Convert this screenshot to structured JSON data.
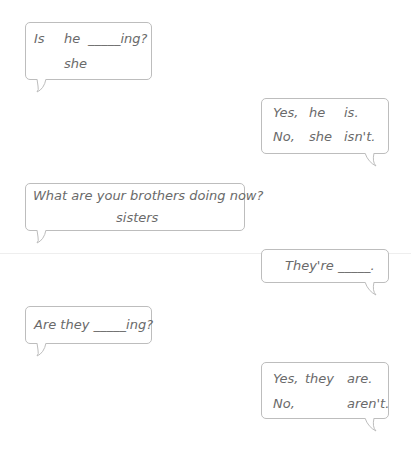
{
  "bubbles": [
    {
      "id": "q1",
      "lines": {
        "a": "Is",
        "b": "he",
        "c": "_____ing?",
        "d": "she"
      }
    },
    {
      "id": "a1",
      "lines": {
        "a": "Yes,",
        "b": "he",
        "c": "is.",
        "d": "No,",
        "e": "she",
        "f": "isn't."
      }
    },
    {
      "id": "q2",
      "lines": {
        "a": "What are your brothers doing now?",
        "b": "sisters"
      }
    },
    {
      "id": "a2",
      "lines": {
        "a": "They're _____."
      }
    },
    {
      "id": "q3",
      "lines": {
        "a": "Are they _____ing?"
      }
    },
    {
      "id": "a3",
      "lines": {
        "a": "Yes,",
        "b": "they",
        "c": "are.",
        "d": "No,",
        "e": "aren't."
      }
    }
  ]
}
